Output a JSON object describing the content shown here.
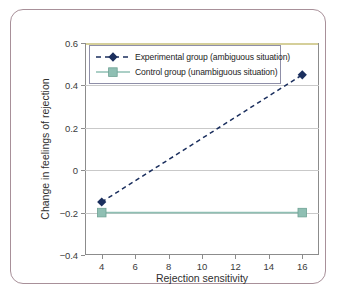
{
  "chart_data": {
    "type": "line",
    "title": "",
    "xlabel": "Rejection sensitivity",
    "ylabel": "Change in feelings of rejection",
    "xlim": [
      3,
      17
    ],
    "ylim": [
      -0.4,
      0.6
    ],
    "xticks": [
      "4",
      "6",
      "8",
      "10",
      "12",
      "14",
      "16"
    ],
    "xtick_values": [
      4,
      6,
      8,
      10,
      12,
      14,
      16
    ],
    "yticks": [
      "0.6",
      "0.4",
      "0.2",
      "0",
      "−0.2",
      "−0.4"
    ],
    "ytick_values": [
      0.6,
      0.4,
      0.2,
      0,
      -0.2,
      -0.4
    ],
    "grid": "horizontal",
    "legend_position": "upper-left-inside",
    "x": [
      4,
      16
    ],
    "series": [
      {
        "name": "Experimental group (ambiguous situation)",
        "values": [
          -0.15,
          0.45
        ],
        "color": "#1b2f5e",
        "linestyle": "dashed",
        "marker": "diamond"
      },
      {
        "name": "Control group (unambiguous situation)",
        "values": [
          -0.2,
          -0.2
        ],
        "color": "#8fbfb3",
        "linestyle": "solid",
        "marker": "square"
      }
    ]
  },
  "legend": {
    "items": [
      {
        "label": "Experimental group (ambiguous situation)"
      },
      {
        "label": "Control group (unambiguous situation)"
      }
    ]
  },
  "colors": {
    "experimental": "#1b2f5e",
    "control": "#8fbfb3",
    "frame": "#a89099",
    "grid": "#c9c9c9",
    "axis": "#8c8c8c",
    "top_spine": "#d5cf9a"
  }
}
